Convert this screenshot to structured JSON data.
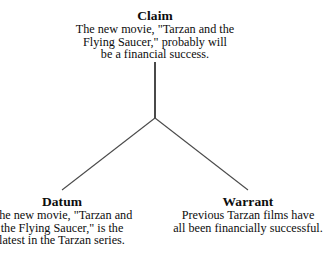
{
  "diagram": {
    "background_color": "#ffffff",
    "text_color": "#0d0d0d",
    "line_color": "#4a4a4a",
    "nodes": {
      "claim": {
        "heading": "Claim",
        "lines": [
          "The new movie, \"Tarzan and the",
          "Flying Saucer,\" probably will",
          "be a financial success."
        ]
      },
      "datum": {
        "heading": "Datum",
        "lines": [
          "The new movie, \"Tarzan and",
          "the Flying Saucer,\" is the",
          "latest in the Tarzan series."
        ]
      },
      "warrant": {
        "heading": "Warrant",
        "lines": [
          "Previous Tarzan films have",
          "all been financially successful."
        ]
      }
    },
    "connectors": {
      "stem": {
        "x1": 155,
        "y1": 62,
        "x2": 155,
        "y2": 118
      },
      "left_branch": {
        "x1": 155,
        "y1": 118,
        "x2": 62,
        "y2": 190
      },
      "right_branch": {
        "x1": 155,
        "y1": 118,
        "x2": 248,
        "y2": 190
      }
    }
  }
}
